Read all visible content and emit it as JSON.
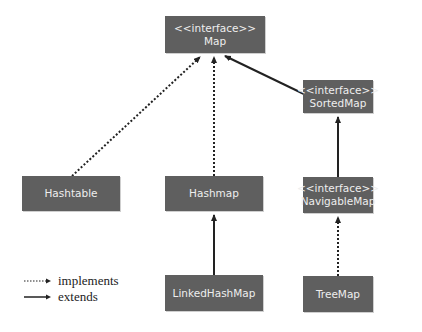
{
  "diagram": {
    "type": "class-hierarchy",
    "colors": {
      "node_fill": "#5f5f5f",
      "node_text": "#eeeeee",
      "edge": "#222222",
      "background": "#ffffff"
    },
    "nodes": [
      {
        "id": "map",
        "stereotype": "<<interface>>",
        "label": "Map"
      },
      {
        "id": "sortedmap",
        "stereotype": "<<interface>>",
        "label": "SortedMap"
      },
      {
        "id": "hashtable",
        "stereotype": "",
        "label": "Hashtable"
      },
      {
        "id": "hashmap",
        "stereotype": "",
        "label": "Hashmap"
      },
      {
        "id": "navigablemap",
        "stereotype": "<<interface>>",
        "label": "NavigableMap"
      },
      {
        "id": "linkedhashmap",
        "stereotype": "",
        "label": "LinkedHashMap"
      },
      {
        "id": "treemap",
        "stereotype": "",
        "label": "TreeMap"
      }
    ],
    "edges": [
      {
        "from": "hashtable",
        "to": "map",
        "kind": "implements"
      },
      {
        "from": "hashmap",
        "to": "map",
        "kind": "implements"
      },
      {
        "from": "sortedmap",
        "to": "map",
        "kind": "extends"
      },
      {
        "from": "navigablemap",
        "to": "sortedmap",
        "kind": "extends"
      },
      {
        "from": "linkedhashmap",
        "to": "hashmap",
        "kind": "extends"
      },
      {
        "from": "treemap",
        "to": "navigablemap",
        "kind": "implements"
      }
    ]
  },
  "legend": {
    "implements": "implements",
    "extends": "extends"
  }
}
